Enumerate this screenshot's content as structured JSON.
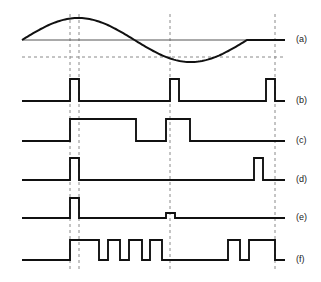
{
  "figure": {
    "title": "",
    "background_color": "#ffffff",
    "trace_color": "#111111",
    "dashed_color": "#8a8a8a",
    "axis_color": "#555555",
    "width": 321,
    "height": 282
  },
  "plot_area": {
    "left": 22,
    "right": 285,
    "top": 8,
    "bottom": 272
  },
  "markers": {
    "vertical_dashed_x": [
      70,
      79,
      170,
      275
    ],
    "horizontal_dashed_y": 57,
    "horizontal_axis_y": 40
  },
  "traces": [
    {
      "id": "a",
      "label": "(a)",
      "label_x": 296,
      "label_y": 40,
      "kind": "sine",
      "baseline_y": 40,
      "amplitude": 22,
      "start_x": 22,
      "end_x": 285,
      "cycle_end_x": 247,
      "description": "one full sine cycle, positive peak near x=75, negative trough near x=170, flat after cycle"
    },
    {
      "id": "b",
      "label": "(b)",
      "label_x": 296,
      "label_y": 101,
      "kind": "pulse",
      "baseline_y": 101,
      "high_y": 79,
      "start_x": 22,
      "end_x": 285,
      "pulses": [
        {
          "from": 70,
          "to": 79
        },
        {
          "from": 170,
          "to": 179
        },
        {
          "from": 266,
          "to": 275
        }
      ]
    },
    {
      "id": "c",
      "label": "(c)",
      "label_x": 296,
      "label_y": 141,
      "kind": "pulse",
      "baseline_y": 141,
      "high_y": 119,
      "start_x": 22,
      "end_x": 285,
      "pulses": [
        {
          "from": 70,
          "to": 136
        },
        {
          "from": 166,
          "to": 190
        }
      ]
    },
    {
      "id": "d",
      "label": "(d)",
      "label_x": 296,
      "label_y": 180,
      "kind": "pulse",
      "baseline_y": 180,
      "high_y": 158,
      "start_x": 22,
      "end_x": 285,
      "pulses": [
        {
          "from": 70,
          "to": 79
        },
        {
          "from": 254,
          "to": 263
        }
      ]
    },
    {
      "id": "e",
      "label": "(e)",
      "label_x": 296,
      "label_y": 218,
      "kind": "pulse",
      "baseline_y": 218,
      "high_y": 198,
      "start_x": 22,
      "end_x": 285,
      "pulses": [
        {
          "from": 70,
          "to": 79,
          "high_y": 198
        },
        {
          "from": 166,
          "to": 175,
          "high_y": 213
        }
      ]
    },
    {
      "id": "f",
      "label": "(f)",
      "label_x": 296,
      "label_y": 260,
      "kind": "pulse",
      "baseline_y": 260,
      "high_y": 240,
      "start_x": 22,
      "end_x": 285,
      "pulses": [
        {
          "from": 70,
          "to": 99
        },
        {
          "from": 108,
          "to": 120
        },
        {
          "from": 129,
          "to": 142
        },
        {
          "from": 150,
          "to": 162
        },
        {
          "from": 228,
          "to": 240
        },
        {
          "from": 249,
          "to": 275
        }
      ]
    }
  ]
}
